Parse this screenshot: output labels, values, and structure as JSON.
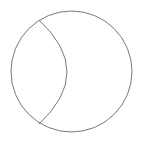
{
  "diagram": {
    "type": "circle-with-inner-arc",
    "background": "#ffffff",
    "stroke_color": "#777777",
    "stroke_width": 1,
    "outer_circle": {
      "cx": 71.5,
      "cy": 71.5,
      "r": 60.5
    },
    "inner_arc": {
      "start": [
        39,
        20
      ],
      "end": [
        39,
        124
      ],
      "control_bulge_x": 67,
      "path": "M 39 20 Q 95 72 39 124"
    }
  }
}
